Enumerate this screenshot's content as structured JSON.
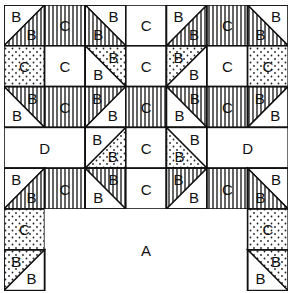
{
  "diagram": {
    "type": "quilt-block-layout",
    "grid": {
      "cols": 7,
      "rows": 7,
      "cell_w": 40.6,
      "cell_h": 40.8
    },
    "colors": {
      "line": "#111111",
      "background": "#ffffff"
    },
    "fills": [
      "white",
      "striped",
      "dotted"
    ],
    "cells": [
      {
        "r": 0,
        "c": 0,
        "kind": "tri",
        "diag": "bl-tr",
        "a": {
          "fill": "white",
          "label": "B"
        },
        "b": {
          "fill": "striped",
          "label": "B"
        }
      },
      {
        "r": 0,
        "c": 1,
        "kind": "sq",
        "fill": "striped",
        "label": "C"
      },
      {
        "r": 0,
        "c": 2,
        "kind": "tri",
        "diag": "tl-br",
        "a": {
          "fill": "white",
          "label": "B"
        },
        "b": {
          "fill": "striped",
          "label": "B"
        }
      },
      {
        "r": 0,
        "c": 3,
        "kind": "sq",
        "fill": "white",
        "label": "C"
      },
      {
        "r": 0,
        "c": 4,
        "kind": "tri",
        "diag": "bl-tr",
        "a": {
          "fill": "white",
          "label": "B"
        },
        "b": {
          "fill": "striped",
          "label": "B"
        }
      },
      {
        "r": 0,
        "c": 5,
        "kind": "sq",
        "fill": "striped",
        "label": "C"
      },
      {
        "r": 0,
        "c": 6,
        "kind": "tri",
        "diag": "tl-br",
        "a": {
          "fill": "white",
          "label": "B"
        },
        "b": {
          "fill": "striped",
          "label": "B"
        }
      },
      {
        "r": 1,
        "c": 0,
        "kind": "sq",
        "fill": "dotted",
        "label": "C"
      },
      {
        "r": 1,
        "c": 1,
        "kind": "sq",
        "fill": "white",
        "label": "C"
      },
      {
        "r": 1,
        "c": 2,
        "kind": "tri",
        "diag": "tl-br",
        "a": {
          "fill": "dotted",
          "label": "B"
        },
        "b": {
          "fill": "white",
          "label": "B"
        }
      },
      {
        "r": 1,
        "c": 3,
        "kind": "sq",
        "fill": "white",
        "label": "C"
      },
      {
        "r": 1,
        "c": 4,
        "kind": "tri",
        "diag": "bl-tr",
        "a": {
          "fill": "dotted",
          "label": "B"
        },
        "b": {
          "fill": "white",
          "label": "B"
        }
      },
      {
        "r": 1,
        "c": 5,
        "kind": "sq",
        "fill": "white",
        "label": "C"
      },
      {
        "r": 1,
        "c": 6,
        "kind": "sq",
        "fill": "dotted",
        "label": "C"
      },
      {
        "r": 2,
        "c": 0,
        "kind": "tri",
        "diag": "tl-br",
        "a": {
          "fill": "striped",
          "label": "B"
        },
        "b": {
          "fill": "white",
          "label": "B"
        }
      },
      {
        "r": 2,
        "c": 1,
        "kind": "sq",
        "fill": "striped",
        "label": "C"
      },
      {
        "r": 2,
        "c": 2,
        "kind": "tri",
        "diag": "bl-tr",
        "a": {
          "fill": "striped",
          "label": "B"
        },
        "b": {
          "fill": "white",
          "label": "B"
        }
      },
      {
        "r": 2,
        "c": 3,
        "kind": "sq",
        "fill": "striped",
        "label": "C"
      },
      {
        "r": 2,
        "c": 4,
        "kind": "tri",
        "diag": "tl-br",
        "a": {
          "fill": "striped",
          "label": "B"
        },
        "b": {
          "fill": "white",
          "label": "B"
        }
      },
      {
        "r": 2,
        "c": 5,
        "kind": "sq",
        "fill": "striped",
        "label": "C"
      },
      {
        "r": 2,
        "c": 6,
        "kind": "tri",
        "diag": "bl-tr",
        "a": {
          "fill": "striped",
          "label": "B"
        },
        "b": {
          "fill": "white",
          "label": "B"
        }
      },
      {
        "r": 3,
        "c": 0,
        "kind": "rect",
        "w": 2,
        "h": 1,
        "fill": "white",
        "label": "D"
      },
      {
        "r": 3,
        "c": 2,
        "kind": "tri",
        "diag": "bl-tr",
        "a": {
          "fill": "white",
          "label": "B"
        },
        "b": {
          "fill": "dotted",
          "label": "B"
        }
      },
      {
        "r": 3,
        "c": 3,
        "kind": "sq",
        "fill": "white",
        "label": "C"
      },
      {
        "r": 3,
        "c": 4,
        "kind": "tri",
        "diag": "tl-br",
        "a": {
          "fill": "white",
          "label": "B"
        },
        "b": {
          "fill": "dotted",
          "label": "B"
        }
      },
      {
        "r": 3,
        "c": 5,
        "kind": "rect",
        "w": 2,
        "h": 1,
        "fill": "white",
        "label": "D"
      },
      {
        "r": 4,
        "c": 0,
        "kind": "tri",
        "diag": "bl-tr",
        "a": {
          "fill": "white",
          "label": "B"
        },
        "b": {
          "fill": "striped",
          "label": "B"
        }
      },
      {
        "r": 4,
        "c": 1,
        "kind": "sq",
        "fill": "striped",
        "label": "C"
      },
      {
        "r": 4,
        "c": 2,
        "kind": "tri",
        "diag": "tl-br",
        "a": {
          "fill": "striped",
          "label": "B"
        },
        "b": {
          "fill": "white",
          "label": "B"
        }
      },
      {
        "r": 4,
        "c": 3,
        "kind": "sq",
        "fill": "white",
        "label": "C"
      },
      {
        "r": 4,
        "c": 4,
        "kind": "tri",
        "diag": "bl-tr",
        "a": {
          "fill": "striped",
          "label": "B"
        },
        "b": {
          "fill": "white",
          "label": "B"
        }
      },
      {
        "r": 4,
        "c": 5,
        "kind": "sq",
        "fill": "striped",
        "label": "C"
      },
      {
        "r": 4,
        "c": 6,
        "kind": "tri",
        "diag": "tl-br",
        "a": {
          "fill": "white",
          "label": "B"
        },
        "b": {
          "fill": "striped",
          "label": "B"
        }
      },
      {
        "r": 5,
        "c": 0,
        "kind": "sq",
        "fill": "dotted",
        "label": "C"
      },
      {
        "r": 5,
        "c": 1,
        "kind": "rect",
        "w": 5,
        "h": 2,
        "fill": "white",
        "label": "A",
        "noborder": true
      },
      {
        "r": 5,
        "c": 6,
        "kind": "sq",
        "fill": "dotted",
        "label": "C"
      },
      {
        "r": 6,
        "c": 0,
        "kind": "tri",
        "diag": "bl-tr",
        "a": {
          "fill": "dotted",
          "label": "B"
        },
        "b": {
          "fill": "white",
          "label": "B"
        }
      },
      {
        "r": 6,
        "c": 6,
        "kind": "tri",
        "diag": "tl-br",
        "a": {
          "fill": "dotted",
          "label": "B"
        },
        "b": {
          "fill": "white",
          "label": "B"
        }
      }
    ]
  }
}
